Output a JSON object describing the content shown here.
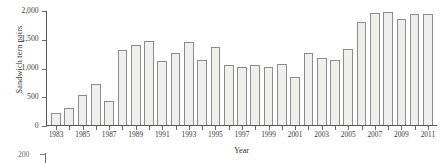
{
  "chart_data": {
    "type": "bar",
    "title": "",
    "xlabel": "Year",
    "ylabel": "Sandwich tern pairs",
    "ylim": [
      0,
      2000
    ],
    "xlim": [
      1983,
      2011
    ],
    "grid": false,
    "legend": null,
    "ytick_labels": [
      "2,000",
      "1,500",
      "1,000",
      "500",
      "0"
    ],
    "ytick_values": [
      2000,
      1500,
      1000,
      500,
      0
    ],
    "xtick_labels": [
      "1983",
      "",
      "1985",
      "",
      "1987",
      "",
      "1989",
      "",
      "1991",
      "",
      "1993",
      "",
      "1995",
      "",
      "1997",
      "",
      "1999",
      "",
      "2001",
      "",
      "2003",
      "",
      "2005",
      "",
      "2007",
      "",
      "2009",
      "",
      "2011"
    ],
    "categories": [
      1983,
      1984,
      1985,
      1986,
      1987,
      1988,
      1989,
      1990,
      1991,
      1992,
      1993,
      1994,
      1995,
      1996,
      1997,
      1998,
      1999,
      2000,
      2001,
      2002,
      2003,
      2004,
      2005,
      2006,
      2007,
      2008,
      2009,
      2010,
      2011
    ],
    "values": [
      200,
      300,
      530,
      710,
      420,
      1320,
      1400,
      1480,
      1130,
      1260,
      1455,
      1140,
      1365,
      1055,
      1025,
      1055,
      1020,
      1075,
      835,
      1270,
      1175,
      1140,
      1325,
      1815,
      1965,
      1980,
      1860,
      1955,
      1955
    ],
    "series": [
      {
        "name": "Sandwich tern pairs",
        "values": [
          200,
          300,
          530,
          710,
          420,
          1320,
          1400,
          1480,
          1130,
          1260,
          1455,
          1140,
          1365,
          1055,
          1025,
          1055,
          1020,
          1075,
          835,
          1270,
          1175,
          1140,
          1325,
          1815,
          1965,
          1980,
          1860,
          1955,
          1955
        ]
      }
    ],
    "bar_fill_color": "#efefed",
    "bar_edge_color": "#8c8c8c",
    "axis_color": "#575757"
  },
  "next_figure": {
    "tick_label": "200"
  }
}
